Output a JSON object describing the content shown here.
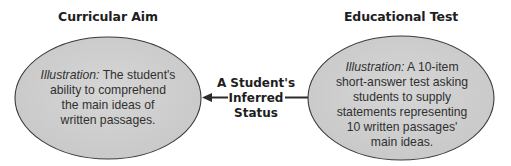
{
  "diagram": {
    "left": {
      "title": "Curricular Aim",
      "illustration_label": "Illustration:",
      "lines": [
        " The student's",
        "ability to comprehend",
        "the main ideas of",
        "written passages."
      ]
    },
    "right": {
      "title": "Educational Test",
      "illustration_label": "Illustration:",
      "lines": [
        " A 10-item",
        "short-answer test asking",
        "students to supply",
        "statements representing",
        "10 written passages'",
        "main ideas."
      ]
    },
    "center": {
      "lines": [
        "A Student's",
        "Inferred",
        "Status"
      ],
      "arrow_direction": "left"
    },
    "colors": {
      "ellipse_fill": "#cfcfcf",
      "ellipse_stroke": "#3a3a3a",
      "connector": "#2b2b2b",
      "title_text": "#1e1e1e"
    }
  }
}
